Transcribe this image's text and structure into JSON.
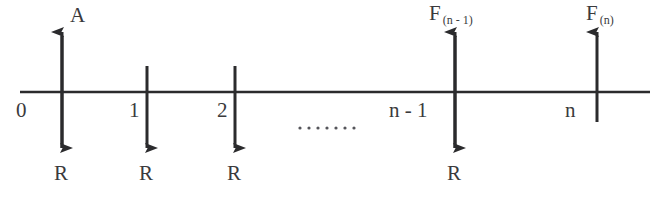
{
  "diagram": {
    "type": "cash-flow-timeline",
    "axis": {
      "label": "time-axis",
      "x_start": 20,
      "x_end": 650,
      "y": 92
    },
    "periods": [
      {
        "index": 0,
        "tick_label": "0",
        "tick_x": 62,
        "up_arrow": {
          "label": "A",
          "present": true
        },
        "down_arrow": {
          "label": "R",
          "present": true
        }
      },
      {
        "index": 1,
        "tick_label": "1",
        "tick_x": 147,
        "up_arrow": {
          "label": "",
          "present": false
        },
        "down_arrow": {
          "label": "R",
          "present": true
        }
      },
      {
        "index": 2,
        "tick_label": "2",
        "tick_x": 235,
        "up_arrow": {
          "label": "",
          "present": false
        },
        "down_arrow": {
          "label": "R",
          "present": true
        }
      },
      {
        "index": 3,
        "tick_label": "n - 1",
        "tick_x": 455,
        "up_arrow": {
          "label": "F",
          "subscript": "(n - 1)",
          "present": true
        },
        "down_arrow": {
          "label": "R",
          "present": true
        }
      },
      {
        "index": 4,
        "tick_label": "n",
        "tick_x": 597,
        "up_arrow": {
          "label": "F",
          "subscript": "(n)",
          "present": true
        },
        "down_arrow": {
          "label": "",
          "present": false
        }
      }
    ],
    "ellipsis": {
      "text": ".......",
      "dot_count": 7
    },
    "colors": {
      "ink": "#3a3a3c",
      "line": "#2b2b2d",
      "background": "#ffffff"
    }
  }
}
